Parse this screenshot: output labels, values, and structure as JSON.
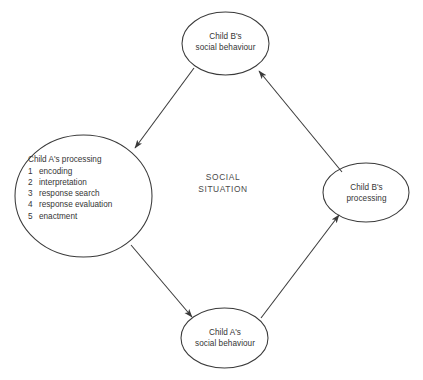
{
  "figure": {
    "center_label": "SOCIAL\nSITUATION",
    "line_color": "#3a3a3a",
    "text_color": "#353535",
    "background_color": "#ffffff"
  },
  "nodes": {
    "top": {
      "id": "child-b-social-behaviour",
      "label": "Child B's\nsocial behaviour"
    },
    "right": {
      "id": "child-b-processing",
      "label": "Child B's\nprocessing"
    },
    "bottom": {
      "id": "child-a-social-behaviour",
      "label": "Child A's\nsocial behaviour"
    },
    "left": {
      "id": "child-a-processing",
      "heading": "Child A's processing",
      "steps": [
        {
          "number": "1",
          "text": "encoding"
        },
        {
          "number": "2",
          "text": "interpretation"
        },
        {
          "number": "3",
          "text": "response search"
        },
        {
          "number": "4",
          "text": "response evaluation"
        },
        {
          "number": "5",
          "text": "enactment"
        }
      ]
    }
  },
  "arrows": [
    {
      "id": "arrow-top-to-left",
      "from": "child-b-social-behaviour",
      "to": "child-a-processing"
    },
    {
      "id": "arrow-left-to-bottom",
      "from": "child-a-processing",
      "to": "child-a-social-behaviour"
    },
    {
      "id": "arrow-bottom-to-right",
      "from": "child-a-social-behaviour",
      "to": "child-b-processing"
    },
    {
      "id": "arrow-right-to-top",
      "from": "child-b-processing",
      "to": "child-b-social-behaviour"
    }
  ],
  "caption": {
    "remnant": ""
  }
}
